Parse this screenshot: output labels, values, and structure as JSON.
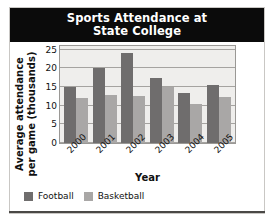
{
  "chart_data": {
    "type": "bar",
    "title": "Sports Attendance at State College",
    "title_lines": [
      "Sports Attendance at",
      "State College"
    ],
    "xlabel": "Year",
    "ylabel": "Average attendance per game (thousands)",
    "ylabel_lines": [
      "Average attendance",
      "per game (thousands)"
    ],
    "categories": [
      "2000",
      "2001",
      "2002",
      "2003",
      "2004",
      "2005"
    ],
    "series": [
      {
        "name": "Football",
        "color": "#6f6d6d",
        "values": [
          15,
          20,
          24,
          17.5,
          13.5,
          15.5
        ]
      },
      {
        "name": "Basketball",
        "color": "#a9a7a6",
        "values": [
          12,
          13,
          12.7,
          15,
          10.5,
          12.4
        ]
      }
    ],
    "ylim": [
      0,
      26
    ],
    "yticks": [
      0,
      5,
      10,
      15,
      20,
      25
    ],
    "ytick_labels": [
      "0",
      "5",
      "10",
      "15",
      "20",
      "25"
    ],
    "grid": true,
    "legend_position": "bottom-left",
    "xtick_rotation": -45
  },
  "legend": {
    "items": [
      {
        "label": "Football",
        "color": "#6f6d6d"
      },
      {
        "label": "Basketball",
        "color": "#a9a7a6"
      }
    ]
  },
  "colors": {
    "title_background": "#0b0b0b",
    "title_text": "#ffffff",
    "plot_background": "#efeeec",
    "gridline": "#a5a3a0",
    "football": "#6f6d6d",
    "basketball": "#a9a7a6"
  }
}
